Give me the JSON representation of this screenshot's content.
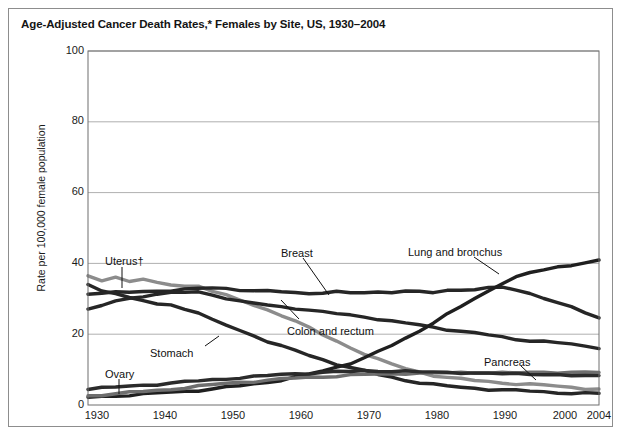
{
  "figure": {
    "title": "Age-Adjusted Cancer Death Rates,* Females by Site, US, 1930–2004"
  },
  "chart_data": {
    "type": "line",
    "title": "Age-Adjusted Cancer Death Rates,* Females by Site, US, 1930–2004",
    "xlabel": "",
    "ylabel": "Rate per 100,000 female population",
    "xlim": [
      1930,
      2004
    ],
    "ylim": [
      0,
      100
    ],
    "grid": true,
    "legend_position": "inline-annotations",
    "xticks": [
      "1930",
      "1940",
      "1950",
      "1960",
      "1970",
      "1980",
      "1990",
      "2000",
      "2004"
    ],
    "xtick_values": [
      1930,
      1940,
      1950,
      1960,
      1970,
      1980,
      1990,
      2000,
      2004
    ],
    "yticks": [
      "0",
      "20",
      "40",
      "60",
      "80",
      "100"
    ],
    "ytick_values": [
      0,
      20,
      40,
      60,
      80,
      100
    ],
    "x": [
      1930,
      1932,
      1934,
      1936,
      1938,
      1940,
      1942,
      1944,
      1946,
      1948,
      1950,
      1952,
      1954,
      1956,
      1958,
      1960,
      1962,
      1964,
      1966,
      1968,
      1970,
      1972,
      1974,
      1976,
      1978,
      1980,
      1982,
      1984,
      1986,
      1988,
      1990,
      1992,
      1994,
      1996,
      1998,
      2000,
      2002,
      2004
    ],
    "series": [
      {
        "name": "Uterus",
        "label": "Uterus†",
        "color": "#8c8c8c",
        "values": [
          36.5,
          35.2,
          36.0,
          35.0,
          35.6,
          34.5,
          34.0,
          33.5,
          33.6,
          32.3,
          31.0,
          29.6,
          28.2,
          26.8,
          25.4,
          23.8,
          21.8,
          19.8,
          18.0,
          16.2,
          14.5,
          12.9,
          11.5,
          10.3,
          9.3,
          8.4,
          7.8,
          7.3,
          6.9,
          6.6,
          6.3,
          6.0,
          5.8,
          5.6,
          5.3,
          5.0,
          4.7,
          4.5
        ]
      },
      {
        "name": "Stomach",
        "label": "Stomach",
        "color": "#262626",
        "values": [
          34.0,
          32.2,
          31.6,
          30.2,
          29.4,
          28.6,
          28.2,
          27.2,
          26.0,
          24.0,
          22.6,
          21.0,
          19.6,
          18.0,
          16.6,
          15.4,
          14.0,
          12.8,
          11.6,
          10.6,
          9.6,
          8.6,
          7.8,
          7.0,
          6.4,
          5.8,
          5.3,
          5.0,
          4.7,
          4.5,
          4.3,
          4.1,
          3.9,
          3.7,
          3.5,
          3.4,
          3.3,
          3.2
        ]
      },
      {
        "name": "Breast",
        "label": "Breast",
        "color": "#262626",
        "values": [
          31.5,
          31.6,
          31.8,
          31.9,
          32.0,
          32.2,
          32.4,
          32.6,
          32.9,
          33.1,
          32.9,
          32.6,
          32.3,
          32.1,
          32.0,
          31.7,
          31.6,
          31.8,
          31.9,
          31.6,
          31.7,
          31.9,
          32.0,
          32.2,
          31.9,
          31.7,
          32.3,
          32.6,
          32.8,
          33.0,
          33.2,
          32.4,
          31.5,
          30.4,
          28.9,
          27.6,
          26.0,
          24.5
        ]
      },
      {
        "name": "Colon and rectum",
        "label": "Colon and rectum",
        "color": "#262626",
        "values": [
          26.9,
          28.0,
          29.4,
          30.1,
          30.8,
          31.3,
          31.6,
          31.8,
          31.9,
          31.2,
          30.2,
          29.2,
          28.7,
          28.2,
          27.8,
          27.4,
          26.8,
          26.2,
          25.8,
          25.4,
          25.0,
          24.3,
          23.6,
          23.1,
          22.6,
          22.0,
          21.4,
          20.8,
          20.3,
          19.8,
          19.2,
          18.6,
          18.2,
          17.9,
          17.6,
          17.2,
          16.6,
          16.2
        ]
      },
      {
        "name": "Lung and bronchus",
        "label": "Lung and bronchus",
        "color": "#1f1f1f",
        "values": [
          2.2,
          2.4,
          2.6,
          2.8,
          3.0,
          3.3,
          3.6,
          3.9,
          4.2,
          4.5,
          5.0,
          5.4,
          5.9,
          6.5,
          7.1,
          7.8,
          8.7,
          9.6,
          10.7,
          11.9,
          13.3,
          15.0,
          16.8,
          18.8,
          21.0,
          23.3,
          25.6,
          27.8,
          30.0,
          32.2,
          34.5,
          36.2,
          37.3,
          38.2,
          38.9,
          39.5,
          40.3,
          40.8
        ]
      },
      {
        "name": "Pancreas",
        "label": "Pancreas",
        "color": "#6e6e6e",
        "values": [
          2.6,
          2.9,
          3.2,
          3.5,
          3.8,
          4.1,
          4.5,
          4.9,
          5.3,
          5.7,
          6.1,
          6.4,
          6.7,
          7.0,
          7.3,
          7.6,
          7.8,
          8.0,
          8.2,
          8.4,
          8.6,
          8.7,
          8.8,
          8.9,
          9.0,
          9.0,
          9.1,
          9.1,
          9.1,
          9.1,
          9.1,
          9.1,
          9.2,
          9.2,
          9.2,
          9.2,
          9.3,
          9.3
        ]
      },
      {
        "name": "Ovary",
        "label": "Ovary",
        "color": "#2b2b2b",
        "values": [
          4.6,
          4.8,
          5.0,
          5.3,
          5.6,
          5.9,
          6.2,
          6.5,
          6.8,
          7.1,
          7.4,
          7.7,
          8.0,
          8.3,
          8.6,
          8.8,
          9.0,
          9.2,
          9.4,
          9.5,
          9.6,
          9.6,
          9.5,
          9.5,
          9.4,
          9.3,
          9.2,
          9.1,
          9.0,
          9.0,
          8.9,
          8.8,
          8.7,
          8.6,
          8.5,
          8.4,
          8.3,
          8.2
        ]
      }
    ],
    "annotations": [
      {
        "name": "uterus",
        "text": "Uterus†",
        "x": 96,
        "y": 247
      },
      {
        "name": "stomach",
        "text": "Stomach",
        "x": 141,
        "y": 339
      },
      {
        "name": "ovary",
        "text": "Ovary",
        "x": 96,
        "y": 360
      },
      {
        "name": "breast",
        "text": "Breast",
        "x": 272,
        "y": 239
      },
      {
        "name": "colon-and-rectum",
        "text": "Colon and rectum",
        "x": 278,
        "y": 317
      },
      {
        "name": "lung-and-bronchus",
        "text": "Lung and bronchus",
        "x": 399,
        "y": 238
      },
      {
        "name": "pancreas",
        "text": "Pancreas",
        "x": 475,
        "y": 348
      }
    ]
  }
}
